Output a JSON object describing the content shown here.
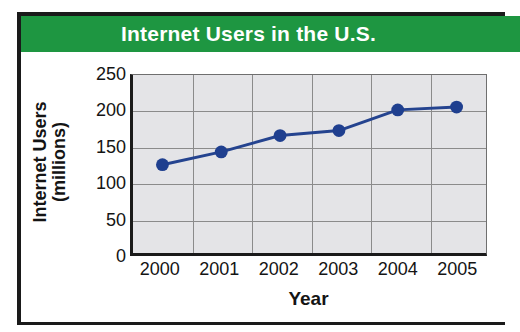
{
  "chart_data": {
    "type": "line",
    "title": "Internet Users in the U.S.",
    "xlabel": "Year",
    "ylabel": "Internet Users (millions)",
    "ylabel_lines": [
      "Internet Users",
      "(millions)"
    ],
    "categories": [
      "2000",
      "2001",
      "2002",
      "2003",
      "2004",
      "2005"
    ],
    "values": [
      124,
      142,
      165,
      172,
      201,
      205
    ],
    "series": [
      {
        "name": "Internet Users",
        "values": [
          124,
          142,
          165,
          172,
          201,
          205
        ]
      }
    ],
    "x": [
      2000,
      2001,
      2002,
      2003,
      2004,
      2005
    ],
    "ylim": [
      0,
      250
    ],
    "yticks": [
      250,
      200,
      150,
      100,
      50,
      0
    ],
    "ytick_labels": [
      "250",
      "200",
      "150",
      "100",
      "50",
      "0"
    ],
    "xtick_labels": [
      "2000",
      "2001",
      "2002",
      "2003",
      "2004",
      "2005"
    ],
    "grid": true,
    "legend": false,
    "legend_position": "none",
    "marker": "circle",
    "colors": {
      "line": "#24438f",
      "marker": "#1f3f8f",
      "title_banner": "#1e9641",
      "title_text": "#ffffff",
      "plot_background": "#e4e4e7",
      "gridline": "#8b8b8b",
      "axis": "#1a1a1a",
      "text": "#141414",
      "page_background": "#ffffff"
    }
  }
}
